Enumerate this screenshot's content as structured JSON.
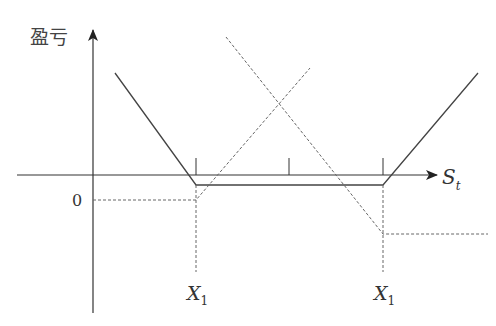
{
  "diagram": {
    "y_axis_label": "盈亏",
    "x_axis_label": {
      "main": "S",
      "sub": "t"
    },
    "origin_label": "0",
    "strike_labels": [
      {
        "main": "X",
        "sub": "1"
      },
      {
        "main": "X",
        "sub": "1"
      }
    ],
    "colors": {
      "axis": "#333333",
      "solid_line": "#444444",
      "dashed_line": "#666666",
      "text": "#333333"
    },
    "elements": [
      "y-axis with arrow",
      "x-axis with arrow",
      "combined payoff (solid V with flat bottom)",
      "long call payoff (dashed, rising)",
      "long put payoff (dashed, falling)",
      "premium level lines (dashed)",
      "strike guide lines (dashed verticals)",
      "tick marks"
    ]
  }
}
